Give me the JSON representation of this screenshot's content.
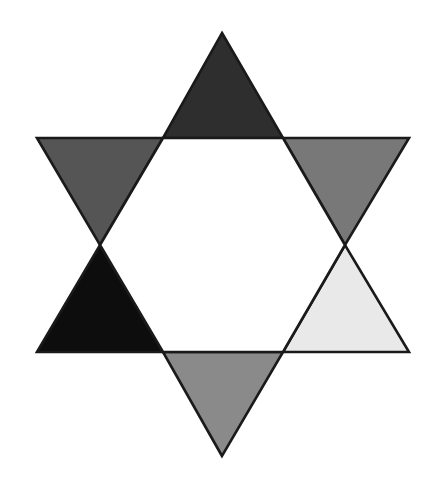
{
  "figure": {
    "shape_name": "hexagram",
    "background_color": "#ffffff",
    "outline_color": "#1a1a1a",
    "outline_width": "2.6",
    "canvas": {
      "width": 435,
      "height": 486
    },
    "center": {
      "x": 222,
      "y": 245
    },
    "outer_radius": 212,
    "inner_radius": 107,
    "core": {
      "name": "center-hexagon",
      "fill": "#ffffff",
      "points": "163,138 283,138 345,245 283,352 163,352 100,245"
    },
    "points": [
      {
        "name": "top-point",
        "position": "top",
        "fill": "#2e2e2e",
        "tone_label": "very dark gray",
        "polygon": "222,33 283,138 163,138"
      },
      {
        "name": "upper-right-point",
        "position": "upper-right",
        "fill": "#787878",
        "tone_label": "mid gray",
        "polygon": "409,138 345,245 283,138"
      },
      {
        "name": "lower-right-point",
        "position": "lower-right",
        "fill": "#e9e9e9",
        "tone_label": "very light gray",
        "polygon": "409,352 283,352 345,245"
      },
      {
        "name": "bottom-point",
        "position": "bottom",
        "fill": "#8a8a8a",
        "tone_label": "medium light gray",
        "polygon": "222,456 163,352 283,352"
      },
      {
        "name": "lower-left-point",
        "position": "lower-left",
        "fill": "#0d0d0d",
        "tone_label": "black",
        "polygon": "37,352 100,245 163,352"
      },
      {
        "name": "upper-left-point",
        "position": "upper-left",
        "fill": "#555555",
        "tone_label": "dark gray",
        "polygon": "37,138 163,138 100,245"
      }
    ]
  }
}
